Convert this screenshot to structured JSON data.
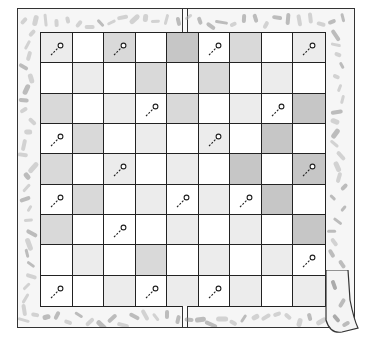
{
  "illustration": {
    "subject": "quilted checkerboard blanket with pins",
    "rows": 9,
    "cols": 9,
    "colors": {
      "W": "#ffffff",
      "L": "#ececec",
      "M": "#d9d9d9",
      "D": "#c6c6c6",
      "line": "#222222",
      "border_fill": "#f6f6f6",
      "speckle": "#9a9a9a"
    },
    "grid": [
      [
        "L",
        "W",
        "M",
        "W",
        "D",
        "W",
        "M",
        "W",
        "L"
      ],
      [
        "W",
        "L",
        "W",
        "M",
        "W",
        "M",
        "W",
        "L",
        "W"
      ],
      [
        "M",
        "W",
        "L",
        "W",
        "M",
        "W",
        "L",
        "W",
        "D"
      ],
      [
        "W",
        "M",
        "W",
        "L",
        "W",
        "L",
        "W",
        "D",
        "W"
      ],
      [
        "M",
        "W",
        "L",
        "W",
        "L",
        "W",
        "D",
        "W",
        "D"
      ],
      [
        "W",
        "M",
        "W",
        "L",
        "W",
        "L",
        "W",
        "D",
        "W"
      ],
      [
        "M",
        "W",
        "W",
        "W",
        "L",
        "W",
        "L",
        "W",
        "D"
      ],
      [
        "W",
        "L",
        "W",
        "M",
        "W",
        "L",
        "W",
        "L",
        "W"
      ],
      [
        "W",
        "W",
        "L",
        "W",
        "L",
        "W",
        "L",
        "W",
        "L"
      ]
    ],
    "pins": [
      [
        0,
        0
      ],
      [
        0,
        2
      ],
      [
        0,
        5
      ],
      [
        0,
        8
      ],
      [
        2,
        3
      ],
      [
        2,
        7
      ],
      [
        3,
        0
      ],
      [
        3,
        5
      ],
      [
        4,
        2
      ],
      [
        4,
        8
      ],
      [
        5,
        0
      ],
      [
        5,
        4
      ],
      [
        5,
        6
      ],
      [
        6,
        2
      ],
      [
        7,
        8
      ],
      [
        8,
        0
      ],
      [
        8,
        3
      ],
      [
        8,
        5
      ]
    ],
    "pin_icon": "sewing-pin-icon",
    "corner": "curled-bottom-right-corner"
  }
}
